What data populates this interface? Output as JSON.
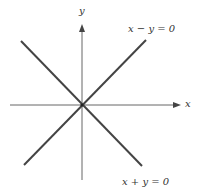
{
  "diagram": {
    "axes": {
      "x_label": "x",
      "y_label": "y"
    },
    "lines": [
      {
        "equation": "x − y = 0",
        "slope": 1
      },
      {
        "equation": "x + y = 0",
        "slope": -1
      }
    ],
    "colors": {
      "axis": "#555555",
      "line": "#444444",
      "text": "#333333",
      "background": "#ffffff"
    }
  }
}
